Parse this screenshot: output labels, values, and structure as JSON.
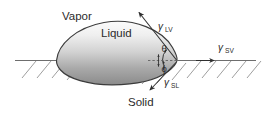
{
  "figure": {
    "name": "contact-angle-diagram",
    "background_color": "#ffffff",
    "line_color": "#3a3a3a",
    "text_color": "#2b2b2b"
  },
  "phases": {
    "vapor_label": "Vapor",
    "liquid_label": "Liquid",
    "solid_label": "Solid"
  },
  "tensions": {
    "lv": {
      "symbol": "γ",
      "subscript": "LV",
      "description": "liquid-vapor interfacial tension"
    },
    "sv": {
      "symbol": "γ",
      "subscript": "SV",
      "description": "solid-vapor interfacial tension"
    },
    "sl": {
      "symbol": "γ",
      "subscript": "SL",
      "description": "solid-liquid interfacial tension"
    }
  },
  "angles": {
    "theta": "θ",
    "phi": "ϕ"
  },
  "droplet": {
    "fill_top_color": "#f2f2f2",
    "fill_bottom_color": "#8e8e8e",
    "outline_color": "#3a3a3a"
  },
  "surface": {
    "baseline_color": "#6e6e6e",
    "hatch_color": "#8a8a8a",
    "hatch_count": 16
  }
}
